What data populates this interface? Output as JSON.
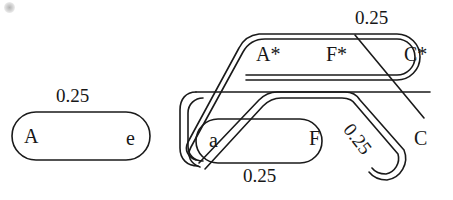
{
  "figure": {
    "type": "knot-tangle-diagram",
    "background_color": "#ffffff",
    "stroke_color": "#1a1a1a",
    "text_color": "#171717"
  },
  "left_component": {
    "name": "simple-loop",
    "weight_label": "0.25",
    "node_left": "A",
    "node_right": "e"
  },
  "right_component": {
    "name": "tangled-loop",
    "node_top_left": "A*",
    "node_top_mid": "F*",
    "node_top_right": "C*",
    "node_bottom_left": "a",
    "node_bottom_mid": "F",
    "node_bottom_right": "C",
    "weight_top_right": "0.25",
    "weight_bottom_left": "0.25",
    "weight_diagonal": "0.25"
  }
}
